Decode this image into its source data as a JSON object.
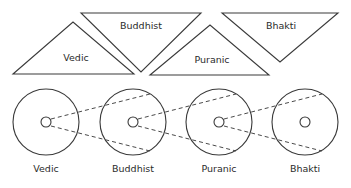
{
  "diagram": {
    "colors": {
      "stroke": "#3a3a3a",
      "dashed_stroke": "#4a4a4a",
      "text": "#2b2b2b",
      "background": "#ffffff"
    },
    "triangles": [
      {
        "id": "vedic",
        "label": "Vedic",
        "orientation": "up",
        "points": "13,74 73,22 134,74",
        "label_x": 76,
        "label_y": 61,
        "label_anchor": "middle"
      },
      {
        "id": "buddhist",
        "label": "Buddhist",
        "orientation": "down",
        "points": "81,13 201,13 141,72",
        "label_x": 141,
        "label_y": 29,
        "label_anchor": "middle"
      },
      {
        "id": "puranic",
        "label": "Puranic",
        "orientation": "up",
        "points": "150,75 210,25 269,75",
        "label_x": 212,
        "label_y": 63,
        "label_anchor": "middle"
      },
      {
        "id": "bhakti",
        "label": "Bhakti",
        "orientation": "down",
        "points": "222,13 338,13 280,62",
        "label_x": 281,
        "label_y": 29,
        "label_anchor": "middle"
      }
    ],
    "stages": [
      {
        "id": "vedic",
        "label": "Vedic",
        "cx": 46,
        "cy": 122,
        "r": 33,
        "core_r": 5,
        "label_x": 46,
        "label_y": 172
      },
      {
        "id": "buddhist",
        "label": "Buddhist",
        "cx": 133,
        "cy": 122,
        "r": 33,
        "core_r": 5,
        "label_x": 133,
        "label_y": 172
      },
      {
        "id": "puranic",
        "label": "Puranic",
        "cx": 219,
        "cy": 122,
        "r": 33,
        "core_r": 5,
        "label_x": 219,
        "label_y": 172
      },
      {
        "id": "bhakti",
        "label": "Bhakti",
        "cx": 305,
        "cy": 122,
        "r": 33,
        "core_r": 5,
        "label_x": 305,
        "label_y": 172
      }
    ],
    "connectors": [
      {
        "id": "vedic-to-buddhist-upper",
        "from": "vedic",
        "to": "buddhist",
        "d": "M 51,119 L 150,94"
      },
      {
        "id": "vedic-to-buddhist-lower",
        "from": "vedic",
        "to": "buddhist",
        "d": "M 51,126 L 150,151"
      },
      {
        "id": "buddhist-to-puranic-upper",
        "from": "buddhist",
        "to": "puranic",
        "d": "M 138,119 L 236,94"
      },
      {
        "id": "buddhist-to-puranic-lower",
        "from": "buddhist",
        "to": "puranic",
        "d": "M 138,126 L 236,151"
      },
      {
        "id": "puranic-to-bhakti-upper",
        "from": "puranic",
        "to": "bhakti",
        "d": "M 224,119 L 322,94"
      },
      {
        "id": "puranic-to-bhakti-lower",
        "from": "puranic",
        "to": "bhakti",
        "d": "M 224,126 L 322,151"
      }
    ]
  }
}
